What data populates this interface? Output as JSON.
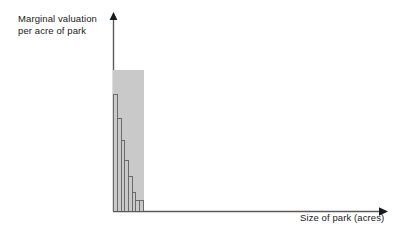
{
  "figure": {
    "width": 411,
    "height": 236,
    "background": "#ffffff"
  },
  "axes": {
    "y_axis_label_line1": "Marginal valuation",
    "y_axis_label_line2": "per acre of park",
    "x_axis_label": "Size of park (acres)",
    "axis_color": "#4d4d4d",
    "y_axis_arrow": "arrow-up",
    "x_axis_arrow": "arrow-right"
  },
  "style": {
    "bar_fill": "#c9c9c9",
    "bar_stroke": "#6b6b6b",
    "text_color": "#1a1a1a"
  },
  "chart_data": {
    "type": "bar",
    "title": "",
    "subtitle": "",
    "xlabel": "Size of park (acres)",
    "ylabel": "Marginal valuation per acre of park",
    "categories": [
      "1",
      "2",
      "3",
      "4",
      "5",
      "6",
      "7",
      "8"
    ],
    "values": [
      100,
      83,
      66,
      50,
      36,
      25,
      13,
      8
    ],
    "bar_pixel_heights": [
      141,
      117,
      93,
      71,
      51,
      35,
      19,
      11
    ],
    "bar_widths": [
      30,
      30,
      30,
      29,
      28,
      30,
      28,
      30
    ],
    "xlim": [
      0,
      8
    ],
    "ylim": [
      0,
      141
    ],
    "grid": false,
    "legend": false,
    "axis_ticks": false,
    "tick_labels": [],
    "annotations": []
  }
}
